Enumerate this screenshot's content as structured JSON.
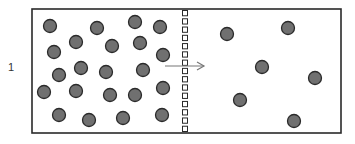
{
  "figure": {
    "label": "1",
    "colors": {
      "particle_fill": "#707070",
      "particle_stroke": "#2a2a2a",
      "line": "#2a2a2a",
      "arrow": "#777777"
    },
    "container": {
      "x": 32,
      "y": 9,
      "width": 309,
      "height": 124
    },
    "membrane": {
      "x": 185,
      "segments": 15
    },
    "arrow": {
      "x1": 165,
      "x2": 204,
      "y": 66,
      "direction": "right"
    },
    "particle_radius": 6.5,
    "left_particles": [
      [
        50,
        26
      ],
      [
        97,
        28
      ],
      [
        135,
        22
      ],
      [
        160,
        27
      ],
      [
        76,
        42
      ],
      [
        112,
        46
      ],
      [
        140,
        43
      ],
      [
        54,
        52
      ],
      [
        163,
        55
      ],
      [
        59,
        75
      ],
      [
        81,
        68
      ],
      [
        106,
        72
      ],
      [
        143,
        70
      ],
      [
        44,
        92
      ],
      [
        76,
        91
      ],
      [
        110,
        95
      ],
      [
        135,
        95
      ],
      [
        163,
        88
      ],
      [
        59,
        115
      ],
      [
        89,
        120
      ],
      [
        123,
        118
      ],
      [
        162,
        115
      ]
    ],
    "right_particles": [
      [
        227,
        34
      ],
      [
        288,
        28
      ],
      [
        262,
        67
      ],
      [
        315,
        78
      ],
      [
        240,
        100
      ],
      [
        294,
        121
      ]
    ]
  }
}
